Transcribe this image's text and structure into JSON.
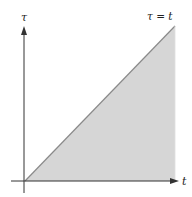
{
  "diagram": {
    "y_axis_label": "τ",
    "x_axis_label": "t",
    "line_label": "τ = t",
    "region_fill": "#d4d4d4",
    "line_color": "#888888",
    "axis_color": "#333333"
  }
}
